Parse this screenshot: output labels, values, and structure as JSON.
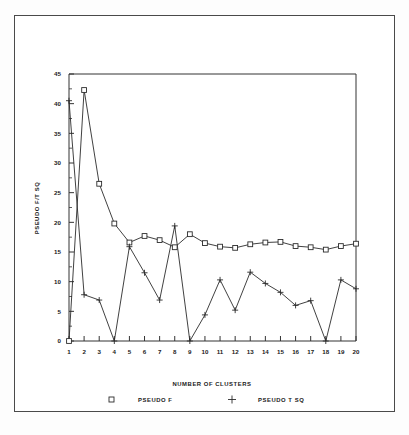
{
  "chart_data": {
    "type": "line",
    "title": "",
    "xlabel": "NUMBER OF CLUSTERS",
    "ylabel": "PSEUDO F/T SQ",
    "x": [
      1,
      2,
      3,
      4,
      5,
      6,
      7,
      8,
      9,
      10,
      11,
      12,
      13,
      14,
      15,
      16,
      17,
      18,
      19,
      20
    ],
    "xlim": [
      1,
      20
    ],
    "ylim": [
      0,
      45
    ],
    "xticks": [
      "1",
      "2",
      "3",
      "4",
      "5",
      "6",
      "7",
      "8",
      "9",
      "10",
      "11",
      "12",
      "13",
      "14",
      "15",
      "16",
      "17",
      "18",
      "19",
      "20"
    ],
    "yticks": [
      "0",
      "5",
      "10",
      "15",
      "20",
      "25",
      "30",
      "35",
      "40",
      "45"
    ],
    "grid": false,
    "legend_position": "bottom",
    "series": [
      {
        "name": "PSEUDO F",
        "marker": "square",
        "values": [
          0,
          42.3,
          26.5,
          19.8,
          16.6,
          17.7,
          17.0,
          15.8,
          18.0,
          16.5,
          15.9,
          15.7,
          16.3,
          16.6,
          16.7,
          16.0,
          15.8,
          15.4,
          16.0,
          16.4
        ]
      },
      {
        "name": "PSEUDO T SQ",
        "marker": "plus",
        "values": [
          40.5,
          7.8,
          6.9,
          0,
          15.9,
          11.5,
          6.9,
          19.4,
          0,
          4.4,
          10.3,
          5.2,
          11.6,
          9.7,
          8.2,
          6.0,
          6.8,
          0,
          10.3,
          8.8
        ]
      }
    ]
  },
  "legend": {
    "entries": [
      {
        "marker_name": "square-marker",
        "label": "PSEUDO F"
      },
      {
        "marker_name": "plus-marker",
        "label": "PSEUDO T SQ"
      }
    ]
  },
  "colors": {
    "line": "#2b2b2b",
    "axis": "#333333",
    "frame": "#4a4a4a",
    "background": "#ffffff"
  }
}
